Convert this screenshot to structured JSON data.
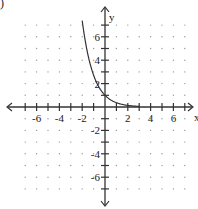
{
  "corner_mark": ")",
  "chart_data": {
    "type": "line",
    "title": "",
    "xlabel": "x",
    "ylabel": "y",
    "xlim": [
      -7,
      7
    ],
    "ylim": [
      -7,
      7
    ],
    "grid": "dots",
    "x_tick_labels": [
      "-6",
      "-4",
      "-2",
      "2",
      "4",
      "6"
    ],
    "x_tick_values": [
      -6,
      -4,
      -2,
      2,
      4,
      6
    ],
    "y_tick_labels": [
      "6",
      "4",
      "2",
      "-2",
      "-4",
      "-6"
    ],
    "y_tick_values": [
      6,
      4,
      2,
      -2,
      -4,
      -6
    ],
    "series": [
      {
        "name": "exponential decay curve",
        "function": "y = e^(-x)",
        "x": [
          -2.0,
          -1.5,
          -1.0,
          -0.5,
          0,
          0.5,
          1.0,
          1.5,
          2.0,
          2.5
        ],
        "y": [
          7.39,
          4.48,
          2.72,
          1.65,
          1.0,
          0.61,
          0.37,
          0.22,
          0.14,
          0.08
        ]
      }
    ],
    "legend": "none"
  }
}
